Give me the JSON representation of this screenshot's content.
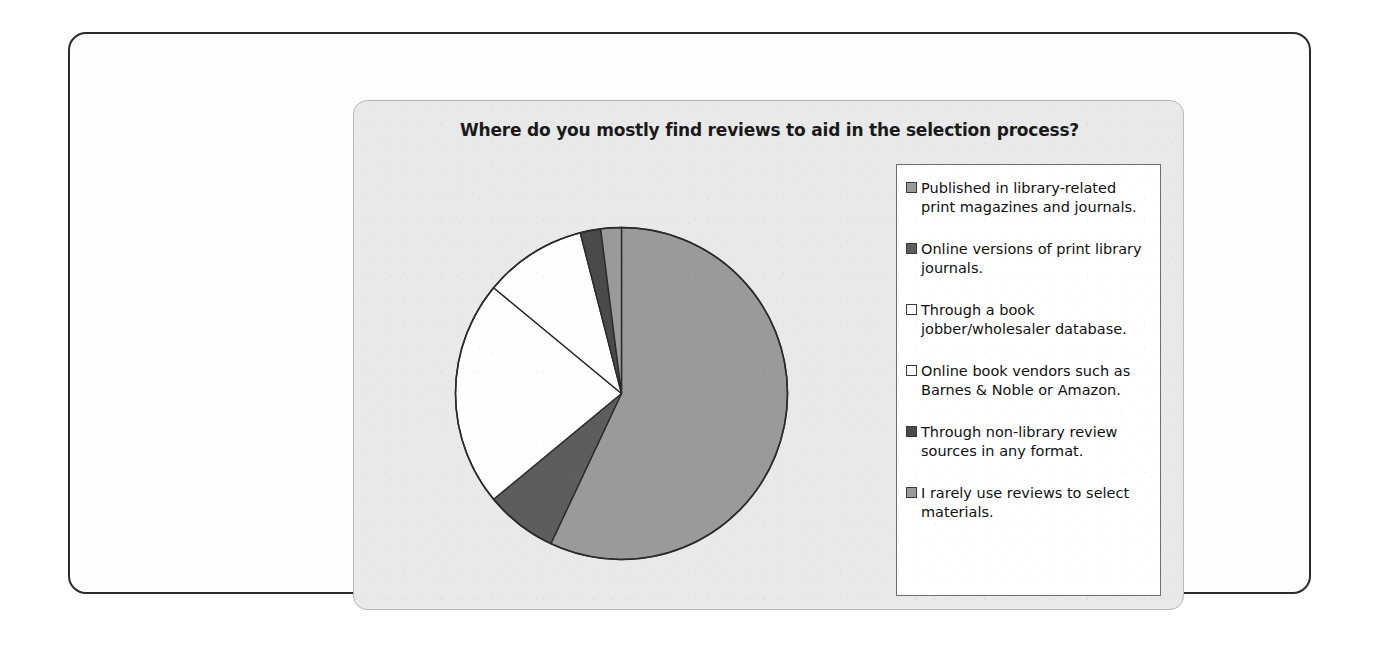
{
  "chart_panel": {
    "title": "Where do you mostly find reviews to aid in the selection process?"
  },
  "colors": {
    "slice_medium_gray": "#9a9a9a",
    "slice_dark_gray": "#5d5d5d",
    "slice_white": "#fefefe",
    "slice_outline": "#2b2b2b",
    "panel_background": "#e9e9e9",
    "legend_background": "#ffffff",
    "legend_border": "#6f6f6f",
    "page_border": "#2b2b2b",
    "text": "#111111"
  },
  "legend": {
    "items": [
      {
        "label": "Published in library-related print magazines and journals.",
        "swatch": "#9a9a9a"
      },
      {
        "label": "Online versions of print library journals.",
        "swatch": "#5d5d5d"
      },
      {
        "label": "Through a book jobber/wholesaler database.",
        "swatch": "#ffffff"
      },
      {
        "label": "Online book vendors such as Barnes & Noble or Amazon.",
        "swatch": "#ffffff"
      },
      {
        "label": "Through non-library review sources in any format.",
        "swatch": "#4a4a4a"
      },
      {
        "label": "I rarely use reviews to select materials.",
        "swatch": "#9a9a9a"
      }
    ]
  },
  "chart_data": {
    "type": "pie",
    "title": "Where do you mostly find reviews to aid in the selection process?",
    "xlabel": "",
    "ylabel": "",
    "legend_position": "right",
    "grid": false,
    "start_angle_deg": 0,
    "direction": "clockwise",
    "categories": [
      "Published in library-related print magazines and journals.",
      "Online versions of print library journals.",
      "Through a book jobber/wholesaler database.",
      "Online book vendors such as Barnes & Noble or Amazon.",
      "Through non-library review sources in any format.",
      "I rarely use reviews to select materials."
    ],
    "values": [
      57,
      7,
      22,
      10,
      2,
      2
    ],
    "colors": [
      "#9a9a9a",
      "#5d5d5d",
      "#fefefe",
      "#fefefe",
      "#4a4a4a",
      "#9a9a9a"
    ],
    "slice_angles_deg": [
      205.2,
      25.2,
      79.2,
      36.0,
      7.2,
      7.2
    ]
  }
}
